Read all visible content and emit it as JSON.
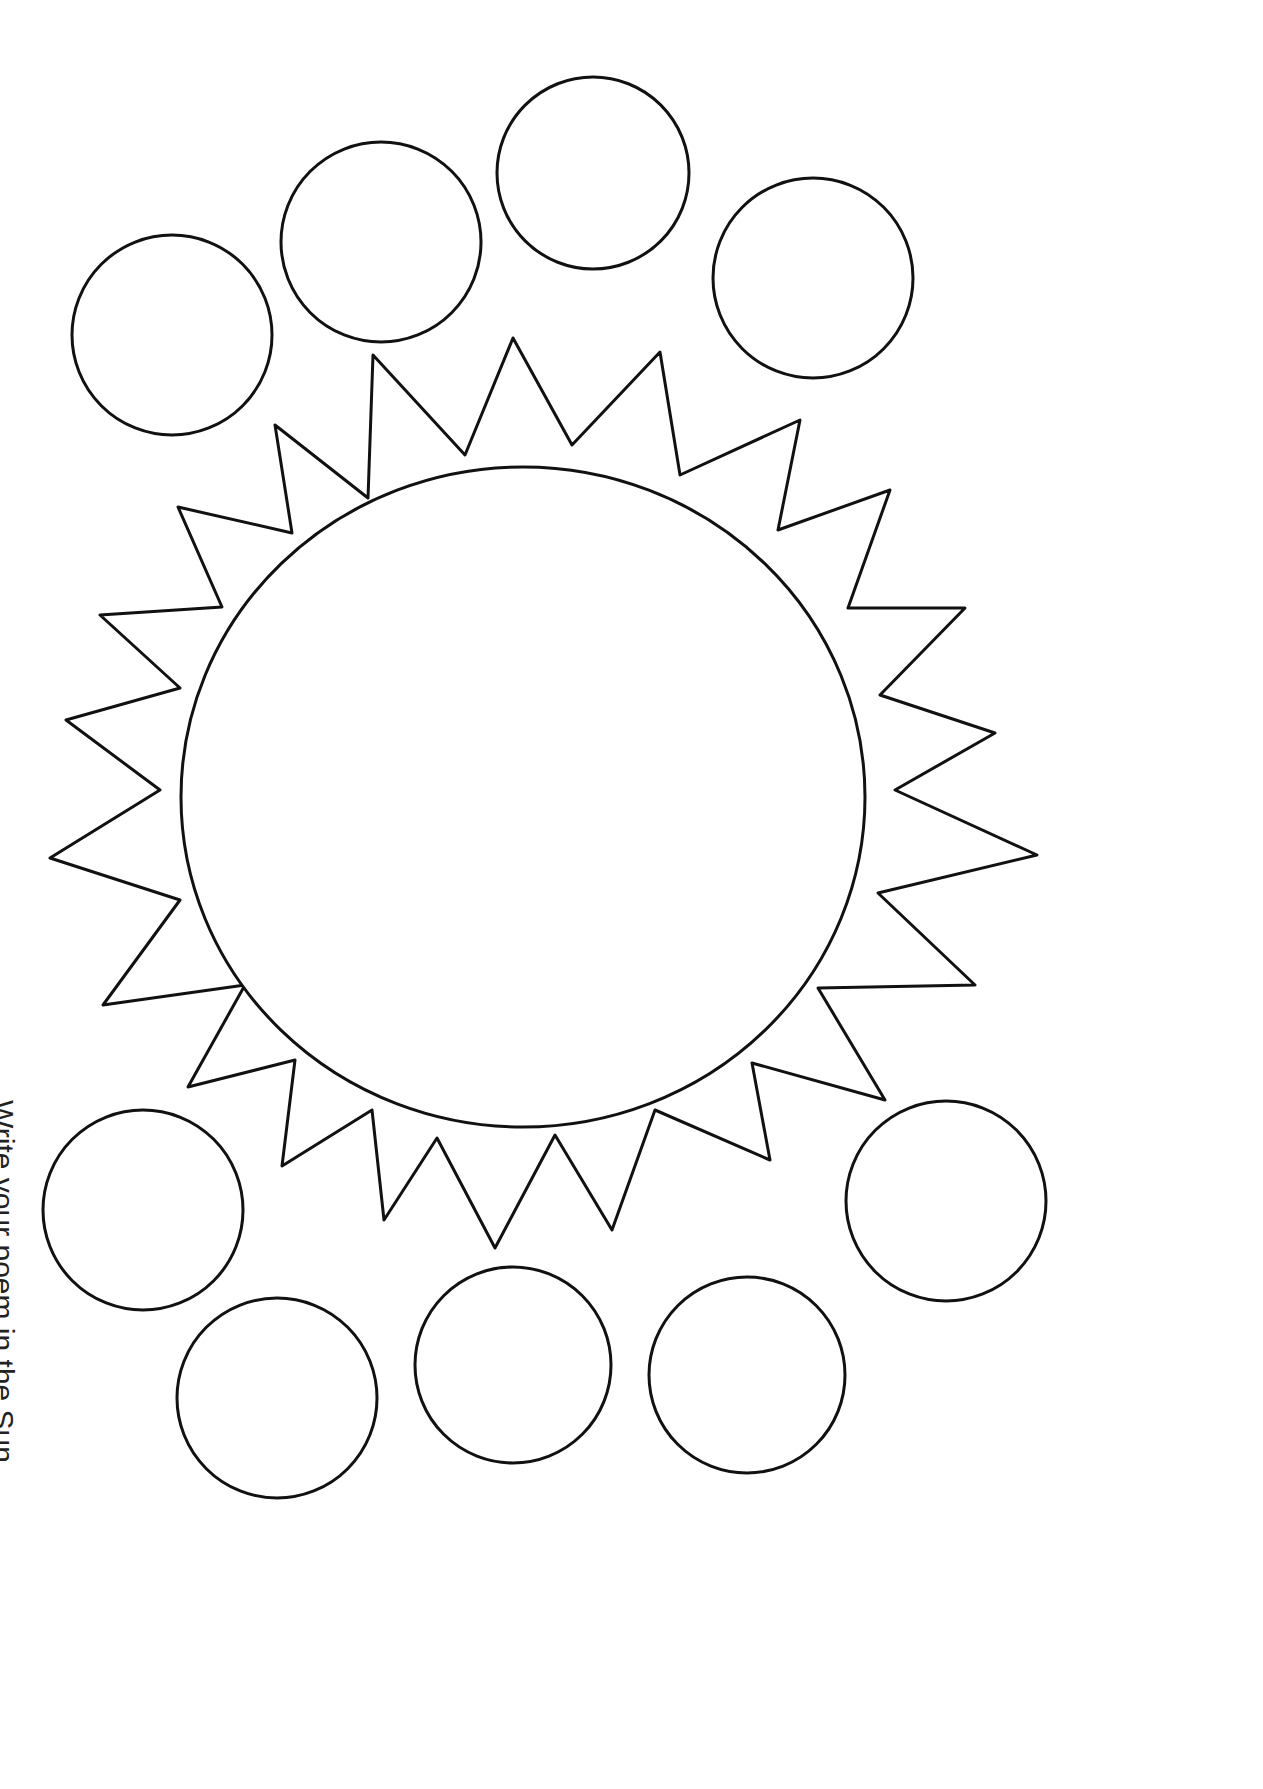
{
  "page": {
    "caption": "Write your poem in the Sun",
    "ink_color": "#111111",
    "paper_color": "#ffffff"
  },
  "shapes": {
    "sun": {
      "label": "sun-outline",
      "center": [
        523,
        797
      ],
      "core_radius": 340
    },
    "circles_top": [
      {
        "cx": 172,
        "cy": 335,
        "r": 100
      },
      {
        "cx": 381,
        "cy": 242,
        "r": 100
      },
      {
        "cx": 593,
        "cy": 173,
        "r": 96
      },
      {
        "cx": 813,
        "cy": 278,
        "r": 100
      }
    ],
    "circles_bottom": [
      {
        "cx": 143,
        "cy": 1210,
        "r": 100
      },
      {
        "cx": 277,
        "cy": 1398,
        "r": 100
      },
      {
        "cx": 513,
        "cy": 1365,
        "r": 98
      },
      {
        "cx": 747,
        "cy": 1375,
        "r": 98
      },
      {
        "cx": 946,
        "cy": 1201,
        "r": 100
      }
    ]
  }
}
